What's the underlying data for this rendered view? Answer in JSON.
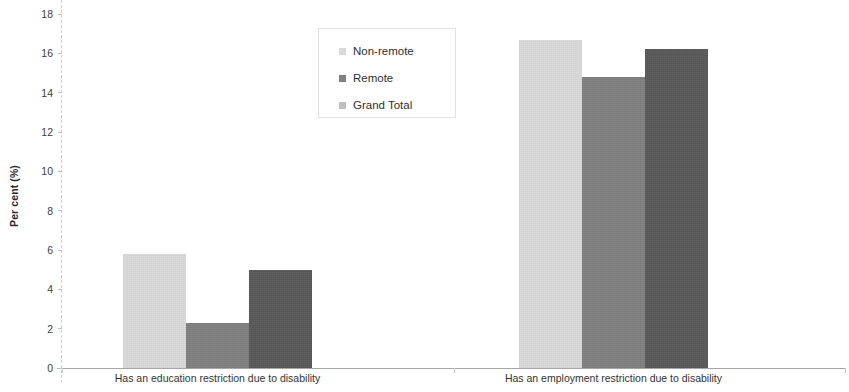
{
  "chart_data": {
    "type": "bar",
    "title": "",
    "subtitle": "",
    "xlabel": "",
    "ylabel": "Per cent (%)",
    "ylim": [
      0,
      18
    ],
    "ytick_step": 2,
    "yticks": [
      0,
      2,
      4,
      6,
      8,
      10,
      12,
      14,
      16,
      18
    ],
    "ytick_labels": [
      "0",
      "2",
      "4",
      "6",
      "8",
      "10",
      "12",
      "14",
      "16",
      "18"
    ],
    "grid": false,
    "legend_position": "top-center",
    "categories": [
      "Has an education restriction due to disability",
      "Has an employment restriction due to disability"
    ],
    "series": [
      {
        "name": "Non-remote",
        "color": "#d9d9d9",
        "values": [
          5.8,
          16.7
        ]
      },
      {
        "name": "Remote",
        "color": "#808080",
        "values": [
          2.3,
          14.8
        ]
      },
      {
        "name": "Grand Total",
        "color": "#595959",
        "values": [
          5.0,
          16.2
        ]
      }
    ]
  },
  "legend": {
    "items": [
      {
        "label": "Non-remote",
        "swatch": "legend-swatch-non-remote"
      },
      {
        "label": "Remote",
        "swatch": "legend-swatch-remote"
      },
      {
        "label": "Grand Total",
        "swatch": "legend-swatch-grand-total"
      }
    ]
  },
  "colors": {
    "non_remote": "#d9d9d9",
    "remote": "#808080",
    "grand_total": "#595959",
    "axis": "#a6a6a6",
    "text": "#333333"
  }
}
